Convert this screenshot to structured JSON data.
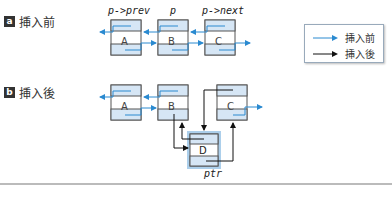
{
  "sections": {
    "before": {
      "badge": "a",
      "label": "挿入前"
    },
    "after": {
      "badge": "b",
      "label": "挿入後"
    }
  },
  "pointers": {
    "prev": "p->prev",
    "p": "p",
    "next": "p->next",
    "ptr": "ptr"
  },
  "nodes": {
    "a": "A",
    "b": "B",
    "c": "C",
    "d": "D"
  },
  "legend": {
    "before": {
      "label": "挿入前",
      "color": "#2a8ad0"
    },
    "after": {
      "label": "挿入後",
      "color": "#111111"
    }
  },
  "colors": {
    "node_fill": "#d6e6f5",
    "node_border": "#555555",
    "highlight": "#5aa0d8"
  }
}
